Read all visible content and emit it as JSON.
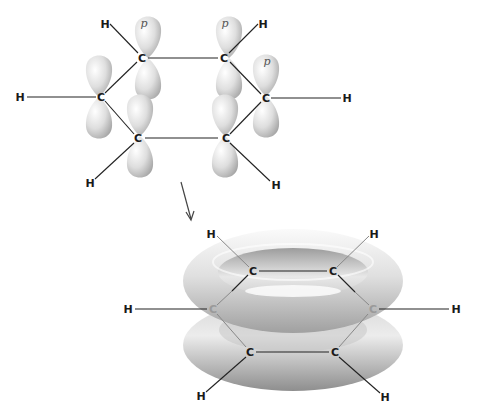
{
  "diagram": {
    "top": {
      "carbons": [
        {
          "label": "C",
          "x": 142,
          "y": 58
        },
        {
          "label": "C",
          "x": 224,
          "y": 58
        },
        {
          "label": "C",
          "x": 266,
          "y": 98
        },
        {
          "label": "C",
          "x": 226,
          "y": 138
        },
        {
          "label": "C",
          "x": 138,
          "y": 138
        },
        {
          "label": "C",
          "x": 101,
          "y": 97
        }
      ],
      "hydrogens": [
        {
          "label": "H",
          "x": 105,
          "y": 24
        },
        {
          "label": "H",
          "x": 263,
          "y": 24
        },
        {
          "label": "H",
          "x": 347,
          "y": 98
        },
        {
          "label": "H",
          "x": 276,
          "y": 185
        },
        {
          "label": "H",
          "x": 90,
          "y": 183
        },
        {
          "label": "H",
          "x": 20,
          "y": 97
        }
      ],
      "orbital_label": "p"
    },
    "arrow": {
      "from": [
        181,
        182
      ],
      "to": [
        192,
        220
      ],
      "color": "#444444"
    },
    "bottom": {
      "carbons": [
        {
          "label": "C",
          "x": 253,
          "y": 271
        },
        {
          "label": "C",
          "x": 333,
          "y": 271
        },
        {
          "label": "C",
          "x": 373,
          "y": 309
        },
        {
          "label": "C",
          "x": 335,
          "y": 352
        },
        {
          "label": "C",
          "x": 250,
          "y": 352
        },
        {
          "label": "C",
          "x": 213,
          "y": 309
        }
      ],
      "hydrogens": [
        {
          "label": "H",
          "x": 211,
          "y": 234
        },
        {
          "label": "H",
          "x": 374,
          "y": 234
        },
        {
          "label": "H",
          "x": 456,
          "y": 309
        },
        {
          "label": "H",
          "x": 385,
          "y": 397
        },
        {
          "label": "H",
          "x": 201,
          "y": 396
        },
        {
          "label": "H",
          "x": 128,
          "y": 309
        }
      ]
    },
    "colors": {
      "orbital_light": "#f2f2f2",
      "orbital_dark": "#a8a8a8",
      "torus_light": "#f0f0f0",
      "torus_dark": "#9a9a9a",
      "bond": "#222222"
    }
  }
}
